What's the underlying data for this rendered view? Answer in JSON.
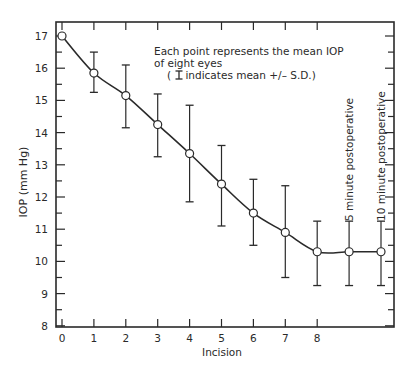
{
  "chart_data": {
    "type": "line",
    "title": "",
    "xlabel": "Incision",
    "ylabel": "IOP (mm Hg)",
    "ylim": [
      8,
      17
    ],
    "yticks": [
      8,
      9,
      10,
      11,
      12,
      13,
      14,
      15,
      16,
      17
    ],
    "x_tick_labels": [
      "0",
      "1",
      "2",
      "3",
      "4",
      "5",
      "6",
      "7",
      "8"
    ],
    "categories": [
      "0",
      "1",
      "2",
      "3",
      "4",
      "5",
      "6",
      "7",
      "8",
      "5 minute postoperative",
      "10 minute postoperative"
    ],
    "series": [
      {
        "name": "Mean IOP",
        "values": [
          17.0,
          15.85,
          15.15,
          14.25,
          13.35,
          12.4,
          11.5,
          10.9,
          10.3,
          10.3,
          10.3
        ],
        "error_upper": [
          null,
          16.5,
          16.1,
          15.2,
          14.85,
          13.6,
          12.55,
          12.35,
          11.25,
          11.25,
          11.25
        ],
        "error_lower": [
          null,
          15.25,
          14.15,
          13.25,
          11.85,
          11.1,
          10.5,
          9.5,
          9.25,
          9.25,
          9.25
        ]
      }
    ],
    "annotations": {
      "note_line1": "Each point represents the mean IOP",
      "note_line2": "of eight eyes",
      "note_line3_prefix": "( ",
      "note_line3_suffix": " indicates mean +/– S.D.)",
      "post5": "5 minute postoperative",
      "post10": "10 minute postoperative"
    },
    "grid": false,
    "legend": "none"
  }
}
